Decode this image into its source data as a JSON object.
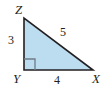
{
  "figure": {
    "kind": "right-triangle-diagram",
    "background_color": "#ffffff",
    "fill_color": "#bcdcf0",
    "stroke_color": "#231f20",
    "text_color": "#231f20",
    "vertices": [
      {
        "name": "Z",
        "label": "Z",
        "x": 24,
        "y": 18
      },
      {
        "name": "Y",
        "label": "Y",
        "x": 24,
        "y": 70
      },
      {
        "name": "X",
        "label": "X",
        "x": 93,
        "y": 70
      }
    ],
    "right_angle": {
      "at_vertex": "Y",
      "marker": "square",
      "size": 10
    },
    "sides": [
      {
        "name": "leg-vertical",
        "endpoints": "ZY",
        "label": "3"
      },
      {
        "name": "leg-horizontal",
        "endpoints": "YX",
        "label": "4"
      },
      {
        "name": "hypotenuse",
        "endpoints": "ZX",
        "label": "5"
      }
    ],
    "polygon_points": "24,18 24,70 93,70"
  }
}
